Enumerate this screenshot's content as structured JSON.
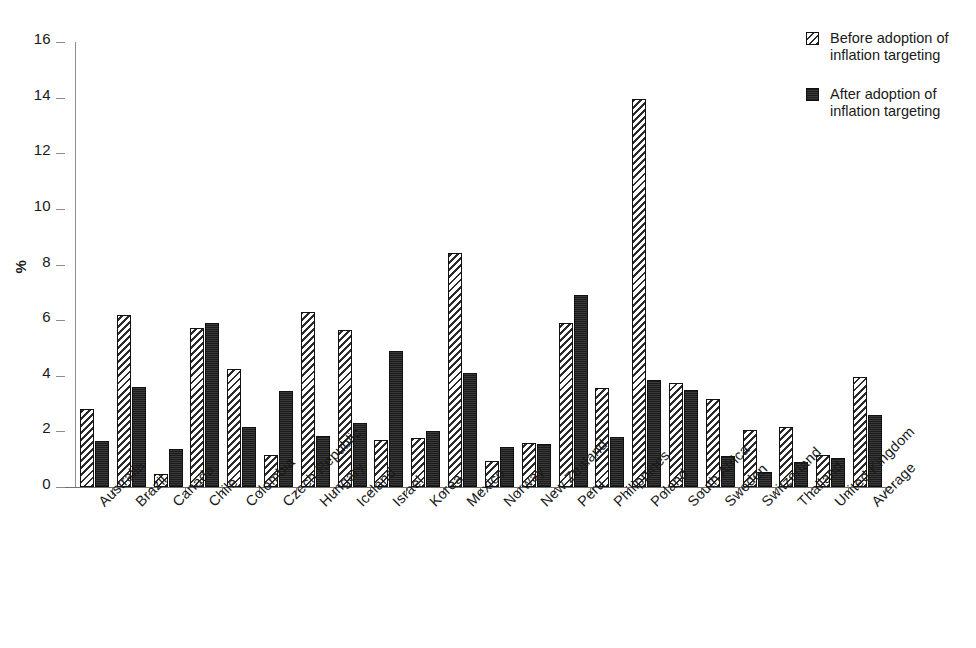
{
  "chart_data": {
    "type": "bar",
    "title": "",
    "xlabel": "",
    "ylabel": "%",
    "ylim": [
      0,
      16
    ],
    "ytick_step": 2,
    "yticks": [
      0,
      2,
      4,
      6,
      8,
      10,
      12,
      14,
      16
    ],
    "grid": false,
    "legend_position": "top-right",
    "categories": [
      "Australia",
      "Brazil",
      "Canada",
      "Chile",
      "Colombia",
      "Czech Republic",
      "Hungary",
      "Iceland",
      "Israel",
      "Korea",
      "Mexico",
      "Norway",
      "New Zealand",
      "Peru",
      "Philippines",
      "Poland",
      "South Africa",
      "Sweden",
      "Switzerland",
      "Thailand",
      "United Kingdom",
      "Average"
    ],
    "series": [
      {
        "name": "Before adoption of inflation targeting",
        "pattern": "diagonal-hatch",
        "color": "#ffffff",
        "values": [
          2.8,
          6.2,
          0.45,
          5.7,
          4.25,
          1.15,
          6.3,
          5.65,
          1.7,
          1.75,
          8.4,
          0.95,
          1.6,
          5.9,
          3.55,
          13.95,
          3.75,
          3.15,
          2.05,
          2.15,
          1.15,
          3.95
        ]
      },
      {
        "name": "After adoption of inflation targeting",
        "pattern": "solid-dark",
        "color": "#272727",
        "values": [
          1.65,
          3.6,
          1.35,
          5.9,
          2.15,
          3.45,
          1.85,
          2.3,
          4.9,
          2.0,
          4.1,
          1.45,
          1.55,
          6.9,
          1.8,
          3.85,
          3.5,
          1.1,
          0.55,
          0.9,
          1.05,
          2.6
        ]
      }
    ]
  },
  "legend": {
    "entries": [
      {
        "label": "Before adoption of\ninflation targeting"
      },
      {
        "label": "After adoption of\ninflation targeting"
      }
    ]
  }
}
